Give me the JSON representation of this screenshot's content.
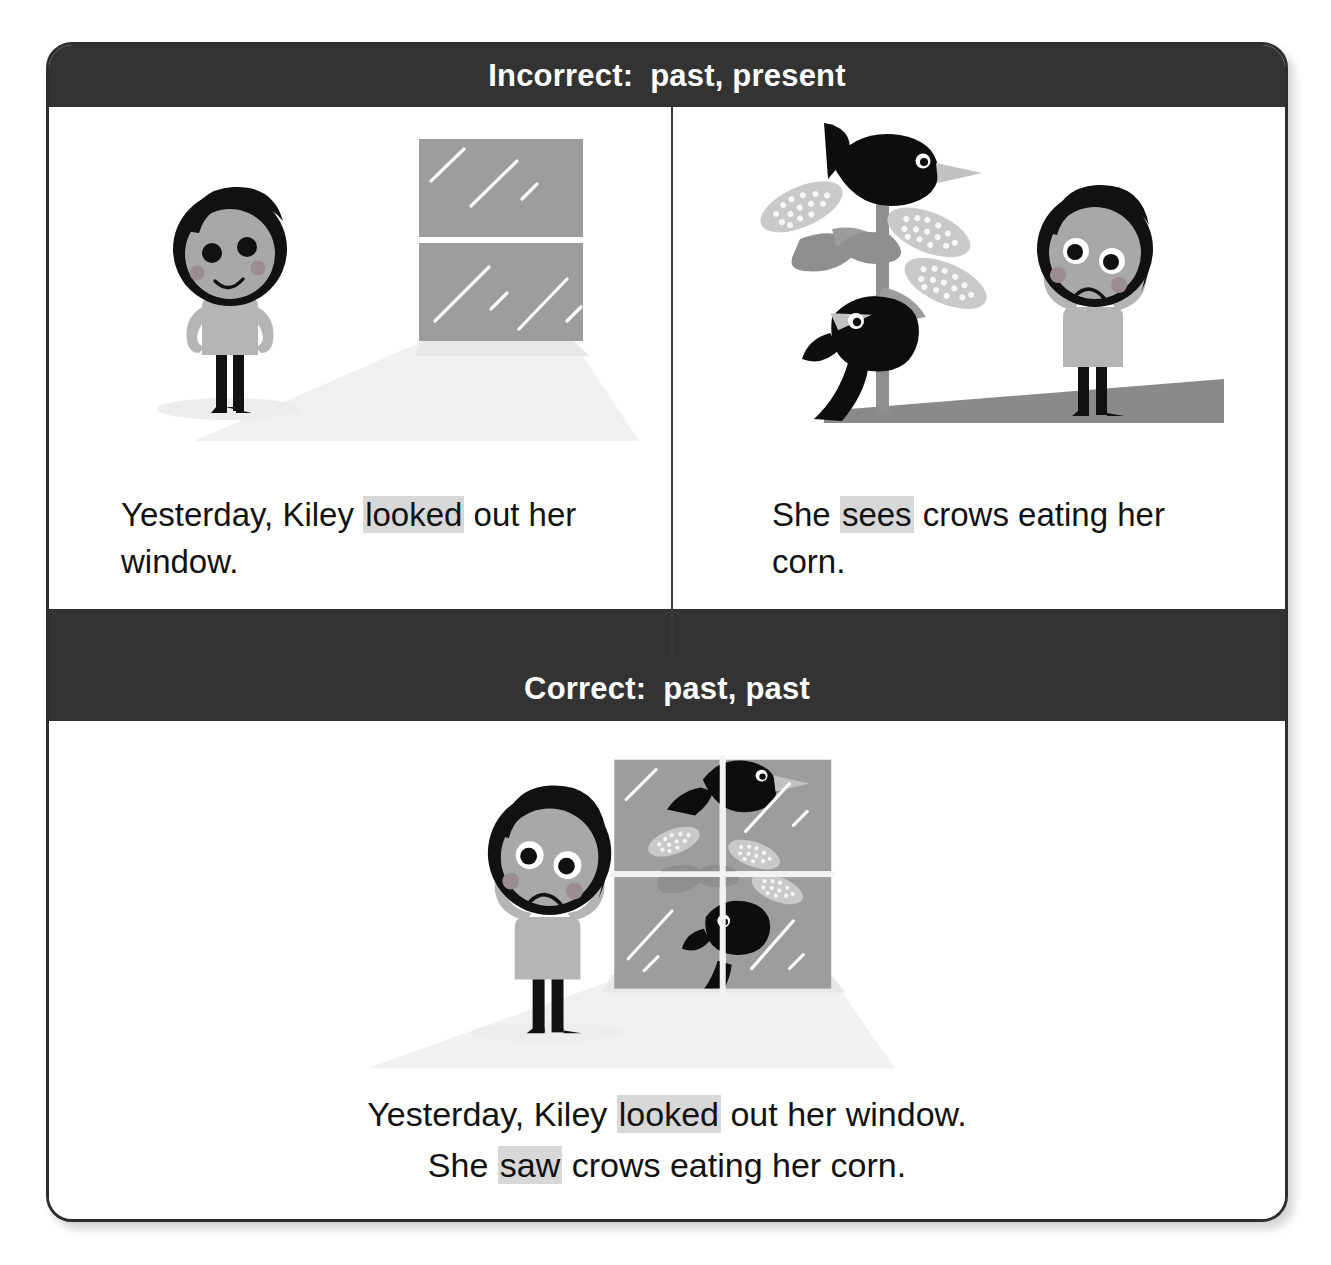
{
  "card": {
    "headers": {
      "incorrect": {
        "label": "Incorrect:",
        "tenses": "past, present"
      },
      "correct": {
        "label": "Correct:",
        "tenses": "past, past"
      }
    },
    "panels": {
      "top_left": {
        "caption_prefix": "Yesterday, Kiley ",
        "caption_highlight": "looked",
        "caption_suffix": " out her window.",
        "scene_name": "girl-smiling-at-window"
      },
      "top_right": {
        "caption_prefix": "She ",
        "caption_highlight": "sees",
        "caption_suffix": " crows eating her corn.",
        "scene_name": "crows-eating-corn-girl-worried"
      },
      "bottom": {
        "line1_prefix": "Yesterday, Kiley ",
        "line1_highlight": "looked",
        "line1_suffix": " out her window.",
        "line2_prefix": "She ",
        "line2_highlight": "saw",
        "line2_suffix": " crows eating her corn.",
        "scene_name": "girl-worried-seeing-crows-through-window"
      }
    },
    "colors": {
      "bar_background": "#333333",
      "bar_text": "#ffffff",
      "highlight": "#d8d8d8",
      "card_border": "#2e2e2e",
      "skin": "#a8a8a8",
      "hair": "#111111",
      "dress": "#b5b5b5",
      "glass": "#9a9a9a",
      "crow": "#0d0d0d",
      "corn": "#c9c9c9",
      "leaf": "#8f8f8f",
      "ground": "#8a8a8a"
    }
  }
}
